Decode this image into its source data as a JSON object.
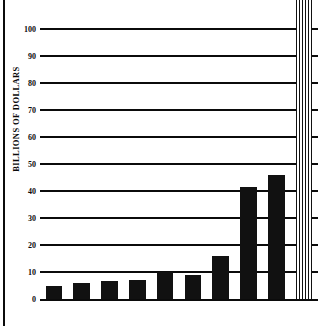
{
  "chart_data": {
    "type": "bar",
    "title": "",
    "subtitle": "",
    "xlabel": "",
    "ylabel": "BILLIONS OF DOLLARS",
    "categories": [
      "1976",
      "1977",
      "1978",
      "1979",
      "1980",
      "1981",
      "1982",
      "1983",
      "1984",
      "1985"
    ],
    "values": [
      5,
      6,
      6.5,
      7,
      10,
      9,
      16,
      41.5,
      46,
      112
    ],
    "ylim": [
      0,
      100
    ],
    "ytick_labels": [
      "0",
      "10",
      "20",
      "30",
      "40",
      "50",
      "60",
      "70",
      "80",
      "90",
      "100"
    ],
    "ytick_values": [
      0,
      10,
      20,
      30,
      40,
      50,
      60,
      70,
      80,
      90,
      100
    ],
    "grid": true,
    "legend": "none",
    "series": [
      {
        "name": "Billions of dollars",
        "values": [
          5,
          6,
          6.5,
          7,
          10,
          9,
          16,
          41.5,
          46,
          112
        ]
      }
    ],
    "notes": [
      "Final bar (1985) is drawn with a vertical striped fill and extends above the top of the plot area, beyond the 100 gridline."
    ]
  },
  "colors": {
    "bar_fill": "#111111",
    "axis": "#0b0b0b",
    "background": "#ffffff"
  }
}
